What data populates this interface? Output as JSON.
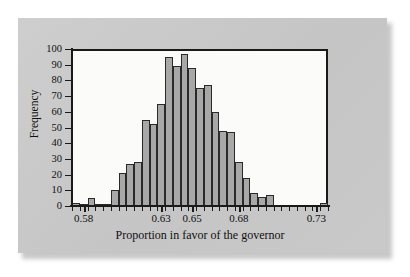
{
  "chart_data": {
    "type": "bar",
    "title": "",
    "subtitle": "",
    "xlabel": "Proportion in favor of the governor",
    "ylabel": "Frequency",
    "xlim": [
      0.5725,
      0.7375
    ],
    "ylim": [
      0,
      100
    ],
    "grid": false,
    "legend": null,
    "bin_width": 0.005,
    "x_tick_labels": [
      "0.58",
      "0.63",
      "0.65",
      "0.68",
      "0.73"
    ],
    "x_tick_values": [
      0.58,
      0.63,
      0.65,
      0.68,
      0.73
    ],
    "y_tick_labels": [
      "0",
      "10",
      "20",
      "30",
      "40",
      "50",
      "60",
      "70",
      "80",
      "90",
      "100"
    ],
    "y_tick_values": [
      0,
      10,
      20,
      30,
      40,
      50,
      60,
      70,
      80,
      90,
      100
    ],
    "bin_starts": [
      0.5725,
      0.5775,
      0.5825,
      0.5875,
      0.5925,
      0.5975,
      0.6025,
      0.6075,
      0.6125,
      0.6175,
      0.6225,
      0.6275,
      0.6325,
      0.6375,
      0.6425,
      0.6475,
      0.6525,
      0.6575,
      0.6625,
      0.6675,
      0.6725,
      0.6775,
      0.6825,
      0.6875,
      0.6925,
      0.6975,
      0.7025,
      0.7075,
      0.7125,
      0.7175,
      0.7225,
      0.7275,
      0.7325
    ],
    "categories": [
      "0.5725",
      "0.5775",
      "0.5825",
      "0.5875",
      "0.5925",
      "0.5975",
      "0.6025",
      "0.6075",
      "0.6125",
      "0.6175",
      "0.6225",
      "0.6275",
      "0.6325",
      "0.6375",
      "0.6425",
      "0.6475",
      "0.6525",
      "0.6575",
      "0.6625",
      "0.6675",
      "0.6725",
      "0.6775",
      "0.6825",
      "0.6875",
      "0.6925",
      "0.6975",
      "0.7025",
      "0.7075",
      "0.7125",
      "0.7175",
      "0.7225",
      "0.7275",
      "0.7325"
    ],
    "values": [
      2,
      1,
      5,
      1,
      1,
      10,
      21,
      27,
      28,
      55,
      52,
      65,
      95,
      89,
      97,
      88,
      75,
      77,
      60,
      48,
      47,
      28,
      18,
      8,
      6,
      7,
      0,
      0,
      0,
      0,
      0,
      0,
      2
    ],
    "bar_face_color": "#a8a8a8",
    "bar_edge_color": "#2a2a2a",
    "plot_bg_color": "#fbfbfa",
    "panel_bg_color": "#c9c9c9",
    "axis_color": "#1a1a1a"
  }
}
